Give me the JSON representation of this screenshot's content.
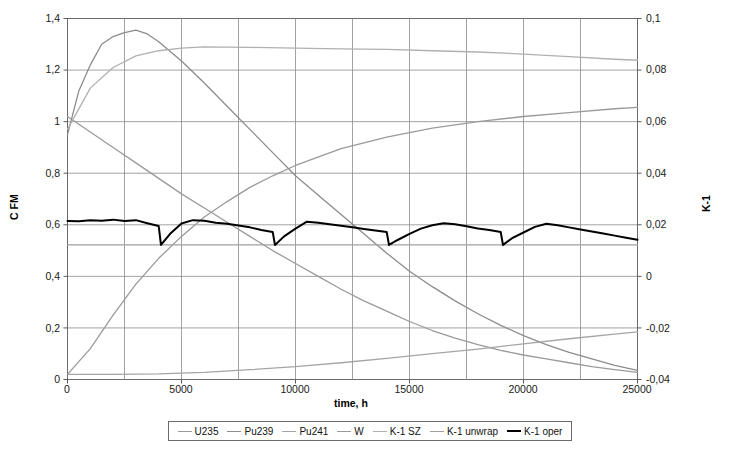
{
  "chart_data": {
    "type": "line",
    "title": "",
    "xlabel": "time, h",
    "ylabel": "C FM",
    "y2label": "K-1",
    "xlim": [
      0,
      25000
    ],
    "ylim": [
      0,
      1.4
    ],
    "y2lim": [
      -0.04,
      0.1
    ],
    "grid": true,
    "legend_position": "bottom",
    "xticks": [
      "0",
      "5000",
      "10000",
      "15000",
      "20000",
      "25000"
    ],
    "yticks": [
      "0",
      "0,2",
      "0,4",
      "0,6",
      "0,8",
      "1",
      "1,2",
      "1,4"
    ],
    "y2ticks": [
      "-0,04",
      "-0,02",
      "0",
      "0,02",
      "0,04",
      "0,06",
      "0,08",
      "0,1"
    ],
    "series": [
      {
        "name": "U235",
        "axis": "left",
        "color": "#9a9a9a",
        "width": 1.3,
        "x": [
          0,
          1000,
          2000,
          3000,
          4000,
          5000,
          6000,
          7000,
          8000,
          9000,
          10000,
          11000,
          12000,
          13000,
          14000,
          15000,
          16000,
          17000,
          18000,
          19000,
          20000,
          21000,
          22000,
          23000,
          24000,
          25000
        ],
        "values": [
          1.02,
          0.96,
          0.9,
          0.84,
          0.78,
          0.72,
          0.665,
          0.61,
          0.555,
          0.5,
          0.45,
          0.4,
          0.35,
          0.305,
          0.265,
          0.225,
          0.19,
          0.16,
          0.135,
          0.113,
          0.095,
          0.08,
          0.065,
          0.05,
          0.038,
          0.028
        ]
      },
      {
        "name": "Pu239",
        "axis": "left",
        "color": "#8c8c8c",
        "width": 1.3,
        "x": [
          0,
          500,
          1000,
          1500,
          2000,
          2500,
          3000,
          3500,
          4000,
          5000,
          6000,
          7000,
          8000,
          9000,
          10000,
          11000,
          12000,
          13000,
          14000,
          15000,
          16000,
          17000,
          18000,
          19000,
          20000,
          21000,
          22000,
          23000,
          24000,
          25000
        ],
        "values": [
          0.95,
          1.12,
          1.22,
          1.3,
          1.33,
          1.345,
          1.355,
          1.34,
          1.31,
          1.235,
          1.15,
          1.06,
          0.97,
          0.88,
          0.79,
          0.715,
          0.64,
          0.565,
          0.49,
          0.42,
          0.36,
          0.305,
          0.255,
          0.21,
          0.17,
          0.135,
          0.105,
          0.08,
          0.055,
          0.035
        ]
      },
      {
        "name": "Pu241",
        "axis": "left",
        "color": "#a5a5a5",
        "width": 1.3,
        "x": [
          0,
          2000,
          4000,
          6000,
          8000,
          10000,
          12000,
          14000,
          16000,
          18000,
          20000,
          22000,
          24000,
          25000
        ],
        "values": [
          0.02,
          0.02,
          0.022,
          0.028,
          0.038,
          0.05,
          0.065,
          0.082,
          0.1,
          0.118,
          0.138,
          0.158,
          0.176,
          0.185
        ]
      },
      {
        "name": "W",
        "axis": "left",
        "color": "#9a9a9a",
        "width": 1.3,
        "x": [
          0,
          1000,
          2000,
          3000,
          4000,
          5000,
          6000,
          7000,
          8000,
          9000,
          10000,
          12000,
          14000,
          16000,
          18000,
          20000,
          22000,
          24000,
          25000
        ],
        "values": [
          0.02,
          0.12,
          0.25,
          0.37,
          0.47,
          0.555,
          0.63,
          0.69,
          0.745,
          0.79,
          0.83,
          0.895,
          0.94,
          0.975,
          1.0,
          1.02,
          1.035,
          1.05,
          1.055
        ]
      },
      {
        "name": "K-1 SZ",
        "axis": "right",
        "color": "#b0b0b0",
        "width": 1.3,
        "x": [
          0,
          1000,
          2000,
          3000,
          4000,
          5000,
          6000,
          8000,
          10000,
          12000,
          14000,
          16000,
          18000,
          20000,
          22000,
          24000,
          25000
        ],
        "values": [
          0.057,
          0.073,
          0.081,
          0.0855,
          0.0875,
          0.0885,
          0.089,
          0.0888,
          0.0885,
          0.0882,
          0.088,
          0.0875,
          0.087,
          0.0862,
          0.0852,
          0.0842,
          0.0838
        ]
      },
      {
        "name": "K-1 unwrap",
        "axis": "right",
        "color": "#a0a0a0",
        "width": 1.3,
        "x": [
          0,
          25000
        ],
        "values": [
          0.0122,
          0.0122
        ]
      },
      {
        "name": "K-1 oper",
        "axis": "right",
        "color": "#000000",
        "width": 2.0,
        "x": [
          0,
          500,
          1000,
          1500,
          2000,
          2500,
          3000,
          3500,
          4000,
          4100,
          4500,
          5000,
          5500,
          6000,
          6500,
          7000,
          7500,
          8000,
          8500,
          9000,
          9100,
          9500,
          10000,
          10500,
          11000,
          11500,
          12000,
          12500,
          13000,
          13500,
          14000,
          14100,
          14500,
          15000,
          15500,
          16000,
          16500,
          17000,
          17500,
          18000,
          18500,
          19000,
          19100,
          19500,
          20000,
          20500,
          21000,
          21500,
          22000,
          22500,
          23000,
          23500,
          24000,
          24500,
          25000
        ],
        "values": [
          0.0215,
          0.0214,
          0.0218,
          0.0216,
          0.022,
          0.0215,
          0.0218,
          0.0206,
          0.0195,
          0.0122,
          0.0165,
          0.0205,
          0.0218,
          0.0216,
          0.0208,
          0.0204,
          0.0197,
          0.019,
          0.018,
          0.0172,
          0.0122,
          0.0155,
          0.0185,
          0.0212,
          0.0208,
          0.0202,
          0.0196,
          0.019,
          0.0184,
          0.0178,
          0.0172,
          0.0122,
          0.0142,
          0.0165,
          0.0185,
          0.0198,
          0.0206,
          0.0202,
          0.0194,
          0.0186,
          0.018,
          0.0172,
          0.0122,
          0.0148,
          0.017,
          0.0192,
          0.0204,
          0.0198,
          0.019,
          0.0182,
          0.0174,
          0.0166,
          0.0158,
          0.015,
          0.0142
        ]
      }
    ]
  },
  "legend": {
    "items": [
      {
        "label": "U235"
      },
      {
        "label": "Pu239"
      },
      {
        "label": "Pu241"
      },
      {
        "label": "W"
      },
      {
        "label": "K-1 SZ"
      },
      {
        "label": "K-1 unwrap"
      },
      {
        "label": "K-1 oper"
      }
    ]
  }
}
